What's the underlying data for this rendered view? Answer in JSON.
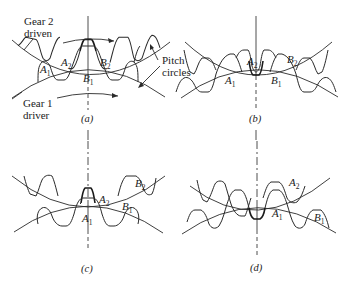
{
  "figure": {
    "annotations": {
      "gear2": "Gear 2",
      "gear2_role": "driven",
      "gear1": "Gear 1",
      "gear1_role": "driver",
      "pitch": "Pitch",
      "circles": "circles"
    },
    "panels": [
      {
        "id": "a",
        "caption": "(a)",
        "labels": {
          "A1": "A",
          "A2": "A",
          "B1": "B",
          "B2": "B"
        }
      },
      {
        "id": "b",
        "caption": "(b)",
        "labels": {
          "A1": "A",
          "A2": "A",
          "B1": "B",
          "B2": "B"
        }
      },
      {
        "id": "c",
        "caption": "(c)",
        "labels": {
          "A1": "A",
          "A2": "A",
          "B1": "B",
          "B2": "B"
        }
      },
      {
        "id": "d",
        "caption": "(d)",
        "labels": {
          "A1": "A",
          "A2": "A",
          "B1": "B"
        }
      }
    ],
    "subscripts": {
      "one": "1",
      "two": "2"
    }
  }
}
